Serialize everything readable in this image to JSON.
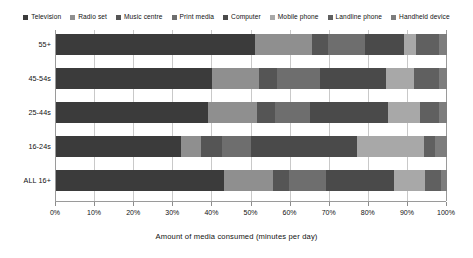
{
  "chart_data": {
    "type": "bar",
    "orientation": "horizontal",
    "stacked": true,
    "normalized_percent": true,
    "title": "",
    "xlabel": "Amount of media consumed (minutes per day)",
    "ylabel": "",
    "xlim": [
      0,
      100
    ],
    "grid": true,
    "legend_position": "top",
    "categories": [
      "55+",
      "45-54s",
      "25-44s",
      "16-24s",
      "ALL 16+"
    ],
    "tick_labels": [
      "0%",
      "10%",
      "20%",
      "30%",
      "40%",
      "50%",
      "60%",
      "70%",
      "80%",
      "90%",
      "100%"
    ],
    "tick_values": [
      0,
      10,
      20,
      30,
      40,
      50,
      60,
      70,
      80,
      90,
      100
    ],
    "series": [
      {
        "name": "Television",
        "color": "#3b3b3b",
        "values": [
          51.0,
          40.0,
          39.0,
          32.0,
          43.0
        ]
      },
      {
        "name": "Radio set",
        "color": "#8f8f8f",
        "values": [
          14.5,
          12.0,
          12.5,
          5.0,
          12.5
        ]
      },
      {
        "name": "Music centre",
        "color": "#555555",
        "values": [
          4.0,
          4.5,
          4.5,
          5.5,
          4.0
        ]
      },
      {
        "name": "Print media",
        "color": "#6e6e6e",
        "values": [
          9.5,
          11.0,
          9.0,
          7.5,
          9.5
        ]
      },
      {
        "name": "Computer",
        "color": "#4a4a4a",
        "values": [
          10.0,
          17.0,
          20.0,
          27.0,
          17.5
        ]
      },
      {
        "name": "Mobile phone",
        "color": "#a8a8a8",
        "values": [
          3.0,
          7.0,
          8.0,
          17.0,
          8.0
        ]
      },
      {
        "name": "Landline phone",
        "color": "#606060",
        "values": [
          6.0,
          6.5,
          5.0,
          3.0,
          4.0
        ]
      },
      {
        "name": "Handheld device",
        "color": "#7d7d7d",
        "values": [
          2.0,
          2.0,
          2.0,
          3.0,
          1.5
        ]
      }
    ]
  },
  "legend": {
    "items": [
      {
        "label": "Television",
        "color": "#3b3b3b"
      },
      {
        "label": "Radio set",
        "color": "#8f8f8f"
      },
      {
        "label": "Music centre",
        "color": "#555555"
      },
      {
        "label": "Print media",
        "color": "#6e6e6e"
      },
      {
        "label": "Computer",
        "color": "#4a4a4a"
      },
      {
        "label": "Mobile phone",
        "color": "#a8a8a8"
      },
      {
        "label": "Landline phone",
        "color": "#606060"
      },
      {
        "label": "Handheld device",
        "color": "#7d7d7d"
      }
    ]
  }
}
